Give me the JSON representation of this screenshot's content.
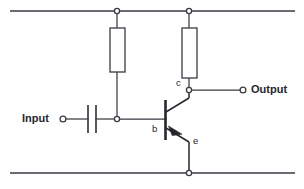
{
  "diagram": {
    "type": "schematic",
    "canvas": {
      "width": 304,
      "height": 189
    },
    "colors": {
      "background": "#ffffff",
      "wire": "#3a3a42",
      "component": "#26262c",
      "fill": "#ffffff"
    }
  },
  "labels": {
    "input": "Input",
    "output": "Output",
    "collector": "c",
    "base": "b",
    "emitter": "e"
  },
  "components": [
    {
      "id": "supply-rail-top",
      "kind": "wire-rail",
      "name": "top-supply-rail",
      "y": 11,
      "x1": 10,
      "x2": 295
    },
    {
      "id": "ground-rail-bottom",
      "kind": "wire-rail",
      "name": "bottom-ground-rail",
      "y": 173,
      "x1": 10,
      "x2": 295
    },
    {
      "id": "R1",
      "kind": "resistor",
      "name": "bias-resistor",
      "orientation": "vertical",
      "x": 110,
      "y": 28,
      "width": 15,
      "height": 44
    },
    {
      "id": "R2",
      "kind": "resistor",
      "name": "collector-load-resistor",
      "orientation": "vertical",
      "x": 182,
      "y": 28,
      "width": 15,
      "height": 50
    },
    {
      "id": "C1",
      "kind": "capacitor",
      "name": "input-coupling-capacitor",
      "orientation": "vertical-plates",
      "plate1_x": 88,
      "plate2_x": 96,
      "y1": 105,
      "y2": 133
    },
    {
      "id": "Q1",
      "kind": "transistor",
      "name": "npn-bipolar-transistor",
      "polarity": "NPN",
      "base_x": 165,
      "base_y1": 100,
      "base_y2": 140,
      "collector_node": {
        "x": 189,
        "y": 90
      },
      "emitter_node": {
        "x": 189,
        "y": 150
      }
    }
  ],
  "nodes": [
    {
      "id": "n-top-r1",
      "name": "top-rail-r1-junction",
      "x": 117,
      "y": 11,
      "style": "open-dot"
    },
    {
      "id": "n-top-r2",
      "name": "top-rail-r2-junction",
      "x": 189,
      "y": 11,
      "style": "open-dot"
    },
    {
      "id": "n-base",
      "name": "base-bias-junction",
      "x": 117,
      "y": 119,
      "style": "open-dot"
    },
    {
      "id": "n-coll",
      "name": "collector-output-junction",
      "x": 189,
      "y": 90,
      "style": "open-dot"
    },
    {
      "id": "n-gnd",
      "name": "emitter-ground-junction",
      "x": 189,
      "y": 173,
      "style": "open-dot"
    }
  ],
  "terminals": [
    {
      "id": "t-input",
      "name": "input-terminal",
      "x": 63,
      "y": 119,
      "label": "Input",
      "side": "left"
    },
    {
      "id": "t-output",
      "name": "output-terminal",
      "x": 243,
      "y": 90,
      "label": "Output",
      "side": "right"
    }
  ],
  "connections": [
    {
      "name": "input-to-capacitor",
      "from": "t-input",
      "to": "C1"
    },
    {
      "name": "capacitor-to-base",
      "from": "C1",
      "to": "n-base"
    },
    {
      "name": "base-node-to-base",
      "from": "n-base",
      "to": "Q1.base"
    },
    {
      "name": "r1-top-to-rail",
      "from": "R1",
      "to": "n-top-r1"
    },
    {
      "name": "r1-bottom-to-base",
      "from": "R1",
      "to": "n-base"
    },
    {
      "name": "r2-top-to-rail",
      "from": "R2",
      "to": "n-top-r2"
    },
    {
      "name": "r2-bottom-to-coll",
      "from": "R2",
      "to": "n-coll"
    },
    {
      "name": "collector-to-output",
      "from": "n-coll",
      "to": "t-output"
    },
    {
      "name": "emitter-to-ground",
      "from": "Q1.emitter",
      "to": "n-gnd"
    }
  ]
}
